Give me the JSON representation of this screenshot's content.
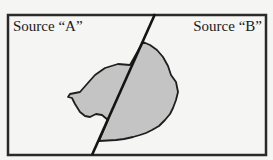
{
  "diagram": {
    "region_left_label": "Source “A”",
    "region_right_label": "Source “B”",
    "colors": {
      "frame": "#2a2a2a",
      "shape_fill": "#c4c4c4",
      "shape_stroke": "#1e1e1e",
      "divider": "#141414",
      "background": "#f5f5f3"
    }
  }
}
